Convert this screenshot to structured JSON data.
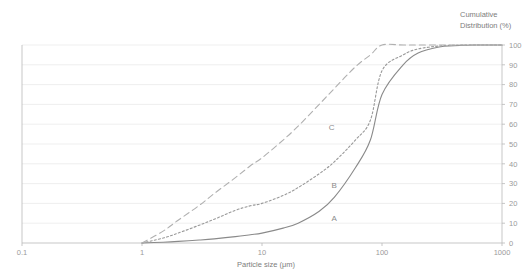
{
  "chart_data": {
    "type": "line",
    "title": "",
    "xlabel": "Particle size (μm)",
    "ylabel": "Cumulative Distribution (%)",
    "ylabel_line1": "Cumulative",
    "ylabel_line2": "Distribution (%)",
    "xscale": "log",
    "xlim": [
      0.1,
      1000
    ],
    "ylim": [
      0,
      100
    ],
    "grid": "horizontal",
    "legend": "inline-labels",
    "xticks": [
      "0.1",
      "1",
      "10",
      "100",
      "1000"
    ],
    "xtick_values": [
      0.1,
      1,
      10,
      100,
      1000
    ],
    "yticks": [
      "0",
      "10",
      "20",
      "30",
      "40",
      "50",
      "60",
      "70",
      "80",
      "90",
      "100"
    ],
    "ytick_values": [
      0,
      10,
      20,
      30,
      40,
      50,
      60,
      70,
      80,
      90,
      100
    ],
    "x": [
      1,
      1.5,
      2,
      3,
      4,
      6,
      8,
      10,
      15,
      20,
      30,
      40,
      60,
      80,
      100,
      150,
      200,
      300,
      400,
      600,
      1000
    ],
    "series": [
      {
        "name": "A",
        "label": "A",
        "style": "solid",
        "color": "#8a8a8a",
        "label_x": 40,
        "label_y": 11,
        "values": [
          0,
          0.4,
          0.8,
          1.5,
          2.1,
          3.2,
          4.2,
          5,
          7.5,
          10,
          16,
          23,
          38,
          52,
          75,
          90,
          96,
          99,
          99.6,
          100,
          100
        ]
      },
      {
        "name": "B",
        "label": "B",
        "style": "dotted",
        "color": "#999999",
        "label_x": 40,
        "label_y": 28,
        "values": [
          0,
          2.5,
          5,
          9,
          12,
          16.5,
          18.8,
          20,
          24,
          28,
          35,
          41,
          52,
          62,
          87,
          95,
          98,
          99.5,
          99.9,
          100,
          100
        ]
      },
      {
        "name": "C",
        "label": "C",
        "style": "dashed",
        "color": "#b0b0b0",
        "label_x": 38,
        "label_y": 57,
        "values": [
          0,
          6,
          11.5,
          19,
          25,
          33,
          39,
          43,
          52,
          59,
          70,
          78,
          89,
          95,
          100,
          100,
          100,
          100,
          100,
          100,
          100
        ]
      }
    ]
  }
}
